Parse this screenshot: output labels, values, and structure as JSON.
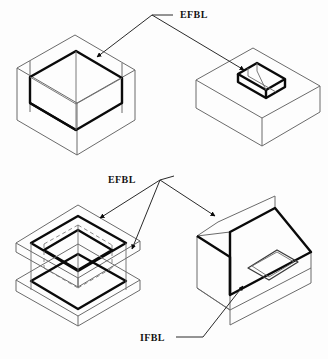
{
  "figure": {
    "background_color": "#fdfdfd",
    "line_color_thin": "#6b6b6b",
    "line_color_thick": "#0a0a0a",
    "hidden_line_color": "#7a7a7a",
    "label_color": "#141414"
  },
  "labels": {
    "efbl_top": "EFBL",
    "efbl_middle": "EFBL",
    "ifbl_bottom": "IFBL"
  },
  "views": [
    {
      "id": "open-box-pocket",
      "position": "top-left",
      "description": "Isometric open box with deep rectangular pocket, thick EFBL rim edges",
      "annotated_by": "EFBL"
    },
    {
      "id": "block-with-slot",
      "position": "top-right",
      "description": "Rectangular block with small raised rectangular slot pocket, thick EFBL edges",
      "annotated_by": "EFBL"
    },
    {
      "id": "exploded-plates",
      "position": "bottom-left",
      "description": "Two stacked plates with rectangular openings and dashed hidden cavity lines",
      "annotated_by": "EFBL"
    },
    {
      "id": "l-bracket-pocket",
      "position": "bottom-right",
      "description": "L-shaped bracket with recessed rectangular pocket showing EFBL rim and IFBL floor",
      "annotated_by": "EFBL, IFBL"
    }
  ],
  "leaders": [
    {
      "from": "efbl_top",
      "to": "open-box-pocket",
      "arrow": true
    },
    {
      "from": "efbl_top",
      "to": "block-with-slot",
      "arrow": true
    },
    {
      "from": "efbl_middle",
      "to": "exploded-plates-upper",
      "arrow": true
    },
    {
      "from": "efbl_middle",
      "to": "exploded-plates-lower",
      "arrow": true
    },
    {
      "from": "efbl_middle",
      "to": "l-bracket-pocket",
      "arrow": true
    },
    {
      "from": "ifbl_bottom",
      "to": "l-bracket-pocket-floor",
      "arrow": true
    }
  ]
}
